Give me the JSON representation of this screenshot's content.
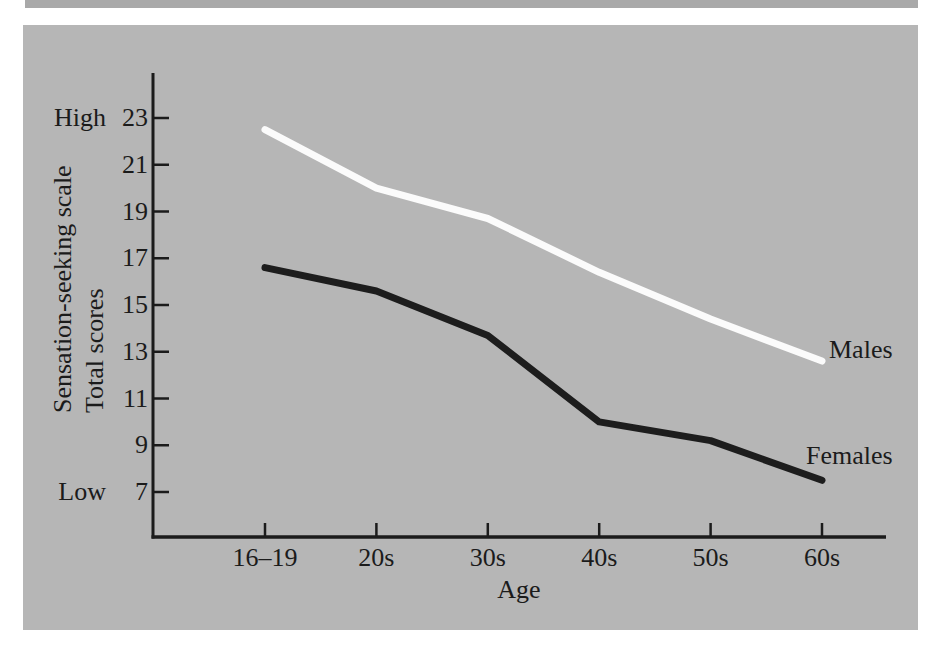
{
  "figure": {
    "high_label": "High",
    "low_label": "Low",
    "y_axis_title_line1": "Sensation-seeking scale",
    "y_axis_title_line2": "Total scores",
    "x_axis_title": "Age",
    "males_label": "Males",
    "females_label": "Females"
  },
  "colors": {
    "panel_background": "#b6b6b6",
    "page_background": "#ffffff",
    "males_line": "#fbfbfb",
    "females_line": "#1d1d1d",
    "axis": "#1b1b1b",
    "text": "#1b1b1b"
  },
  "chart_data": {
    "type": "line",
    "title": "",
    "xlabel": "Age",
    "ylabel": "Sensation-seeking scale Total scores",
    "categories": [
      "16–19",
      "20s",
      "30s",
      "40s",
      "50s",
      "60s"
    ],
    "y_ticks": [
      23,
      21,
      19,
      17,
      15,
      13,
      11,
      9,
      7
    ],
    "y_tick_end_labels": {
      "top": "High",
      "bottom": "Low"
    },
    "ylim": [
      5.1,
      24.9
    ],
    "grid": false,
    "legend_position": "right-of-line-end",
    "series": [
      {
        "name": "Males",
        "color": "#fbfbfb",
        "values": [
          22.5,
          20.0,
          18.7,
          16.4,
          14.4,
          12.6
        ]
      },
      {
        "name": "Females",
        "color": "#1d1d1d",
        "values": [
          16.6,
          15.6,
          13.7,
          10.0,
          9.2,
          7.5
        ]
      }
    ]
  }
}
